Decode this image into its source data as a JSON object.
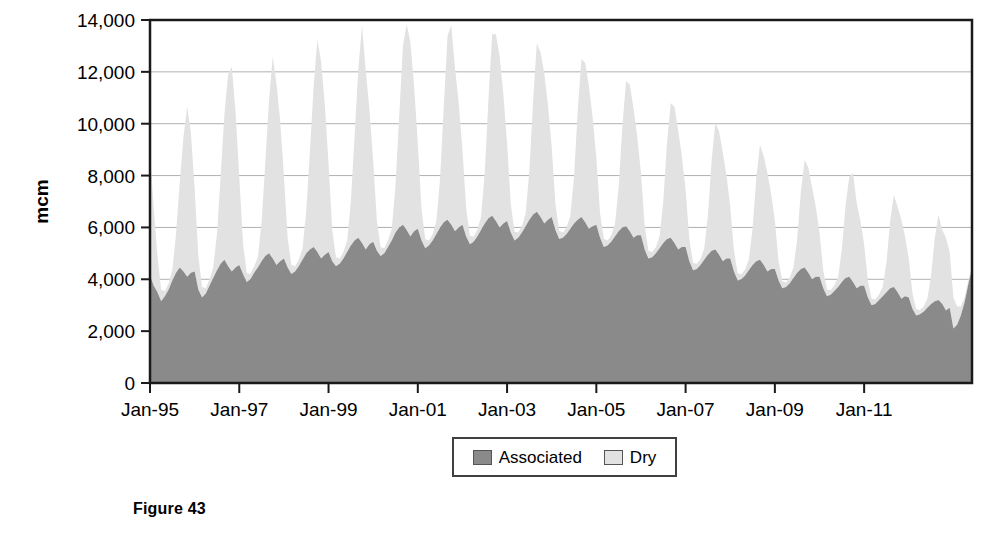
{
  "figure": {
    "caption": "Figure 43"
  },
  "legend": {
    "entries": [
      {
        "label": "Associated",
        "color": "#8a8a8a"
      },
      {
        "label": "Dry",
        "color": "#e2e2e2"
      }
    ]
  },
  "chart_data": {
    "type": "area",
    "stacked": true,
    "title": "",
    "xlabel": "",
    "ylabel": "mcm",
    "ylim": [
      0,
      14000
    ],
    "ytick_values": [
      0,
      2000,
      4000,
      6000,
      8000,
      10000,
      12000,
      14000
    ],
    "ytick_labels": [
      "0",
      "2,000",
      "4,000",
      "6,000",
      "8,000",
      "10,000",
      "12,000",
      "14,000"
    ],
    "xtick_labels": [
      "Jan-95",
      "Jan-97",
      "Jan-99",
      "Jan-01",
      "Jan-03",
      "Jan-05",
      "Jan-07",
      "Jan-09",
      "Jan-11"
    ],
    "xtick_index": [
      0,
      24,
      48,
      72,
      96,
      120,
      144,
      168,
      192
    ],
    "x_start_label": "Jan-95",
    "x_end_label": "Jun-12",
    "grid": "horizontal",
    "legend_position": "bottom-center",
    "n_points": 210,
    "series": [
      {
        "name": "Associated",
        "color": "#8a8a8a",
        "values": [
          4150,
          3750,
          3500,
          3150,
          3350,
          3600,
          3950,
          4250,
          4450,
          4300,
          4100,
          4250,
          4300,
          3600,
          3300,
          3450,
          3750,
          4050,
          4350,
          4600,
          4750,
          4500,
          4300,
          4450,
          4550,
          4200,
          3900,
          4000,
          4250,
          4450,
          4700,
          4900,
          5000,
          4800,
          4550,
          4700,
          4800,
          4450,
          4200,
          4300,
          4500,
          4750,
          5000,
          5150,
          5250,
          5050,
          4800,
          4950,
          5050,
          4700,
          4500,
          4600,
          4800,
          5050,
          5300,
          5500,
          5600,
          5400,
          5150,
          5350,
          5450,
          5100,
          4900,
          5000,
          5250,
          5500,
          5800,
          6000,
          6100,
          5900,
          5650,
          5850,
          5950,
          5500,
          5200,
          5300,
          5500,
          5750,
          6000,
          6200,
          6300,
          6100,
          5850,
          6000,
          6100,
          5650,
          5350,
          5450,
          5650,
          5900,
          6150,
          6350,
          6450,
          6250,
          6000,
          6150,
          6250,
          5800,
          5500,
          5600,
          5800,
          6050,
          6300,
          6500,
          6600,
          6400,
          6150,
          6300,
          6400,
          5900,
          5550,
          5600,
          5750,
          5950,
          6150,
          6300,
          6400,
          6200,
          5950,
          6050,
          6100,
          5600,
          5250,
          5300,
          5450,
          5650,
          5850,
          6000,
          6050,
          5850,
          5600,
          5700,
          5700,
          5150,
          4800,
          4850,
          5000,
          5200,
          5400,
          5550,
          5600,
          5400,
          5150,
          5250,
          5250,
          4700,
          4350,
          4400,
          4550,
          4750,
          4950,
          5100,
          5150,
          4950,
          4700,
          4800,
          4800,
          4300,
          3950,
          4000,
          4150,
          4350,
          4550,
          4700,
          4750,
          4550,
          4300,
          4400,
          4400,
          3950,
          3650,
          3700,
          3850,
          4050,
          4250,
          4400,
          4450,
          4250,
          4000,
          4100,
          4100,
          3650,
          3350,
          3400,
          3550,
          3700,
          3900,
          4050,
          4100,
          3900,
          3650,
          3750,
          3750,
          3300,
          3000,
          3050,
          3200,
          3350,
          3500,
          3650,
          3700,
          3500,
          3250,
          3350,
          3300,
          2850,
          2600,
          2650,
          2750,
          2900,
          3050,
          3150,
          3200,
          3050,
          2800,
          2900,
          2100,
          2250,
          2600,
          3100,
          3800,
          4400
        ]
      },
      {
        "name": "Dry",
        "color": "#e2e2e2",
        "values": [
          4750,
          3000,
          1400,
          450,
          200,
          250,
          400,
          1500,
          3300,
          5200,
          6550,
          5400,
          3200,
          1300,
          400,
          200,
          250,
          400,
          1400,
          3400,
          5600,
          7400,
          7900,
          6000,
          3400,
          1200,
          350,
          200,
          250,
          400,
          1500,
          3600,
          5900,
          7800,
          7000,
          5400,
          3200,
          1150,
          350,
          200,
          250,
          450,
          1600,
          3800,
          6200,
          8200,
          7600,
          5800,
          3400,
          1200,
          350,
          200,
          250,
          450,
          1700,
          4000,
          6500,
          8400,
          6900,
          5200,
          3100,
          1150,
          350,
          200,
          250,
          450,
          1800,
          4300,
          6900,
          7950,
          7500,
          5600,
          3300,
          1200,
          350,
          200,
          250,
          500,
          1900,
          4500,
          7100,
          7700,
          6300,
          4800,
          2900,
          1100,
          330,
          200,
          250,
          500,
          1950,
          4600,
          7000,
          7200,
          6600,
          5000,
          3000,
          1100,
          330,
          200,
          250,
          500,
          1900,
          4400,
          6500,
          6350,
          5800,
          4400,
          2700,
          1000,
          320,
          200,
          250,
          480,
          1800,
          4200,
          6100,
          6150,
          5500,
          4200,
          2600,
          950,
          310,
          200,
          240,
          470,
          1700,
          3900,
          5600,
          5650,
          5000,
          3800,
          2400,
          900,
          300,
          200,
          240,
          450,
          1600,
          3700,
          5200,
          5250,
          4600,
          3500,
          2200,
          850,
          290,
          190,
          230,
          430,
          1500,
          3500,
          4900,
          4750,
          4200,
          3200,
          2000,
          800,
          280,
          190,
          230,
          410,
          1400,
          3200,
          4450,
          4200,
          3800,
          2900,
          1850,
          750,
          270,
          180,
          220,
          400,
          1300,
          3000,
          4150,
          4050,
          3550,
          2700,
          1700,
          700,
          260,
          180,
          220,
          380,
          1250,
          2800,
          3850,
          4200,
          3300,
          2500,
          1600,
          650,
          250,
          170,
          210,
          360,
          1150,
          2600,
          3550,
          3300,
          3050,
          2300,
          1500,
          600,
          240,
          170,
          200,
          350,
          1100,
          2450,
          3300,
          2850,
          2800,
          2150,
          1200,
          700,
          350,
          200,
          150,
          100
        ]
      }
    ]
  }
}
